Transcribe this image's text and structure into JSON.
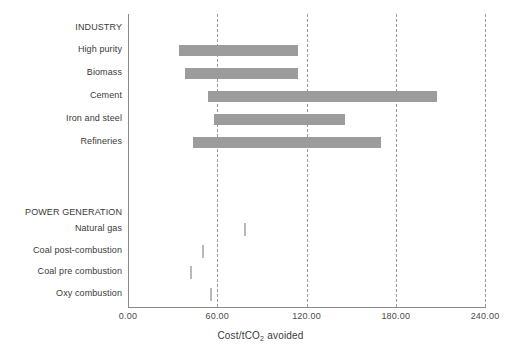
{
  "chart_data": {
    "type": "bar",
    "orientation": "horizontal",
    "title": "",
    "xlabel": "Cost/tCO2 avoided",
    "ylabel": "",
    "xlim": [
      0,
      240
    ],
    "xticks": [
      "0.00",
      "60.00",
      "120.00",
      "180.00",
      "240.00"
    ],
    "xtick_values": [
      0,
      60,
      120,
      180,
      240
    ],
    "grid": "vertical dashed gridlines at each x tick",
    "legend": "none",
    "bar_color": "#9c9c9c",
    "marker_color": "#b9b9b9",
    "groups": [
      {
        "name": "INDUSTRY",
        "categories": [
          {
            "label": "High purity",
            "low": 34,
            "high": 114
          },
          {
            "label": "Biomass",
            "low": 38,
            "high": 114
          },
          {
            "label": "Cement",
            "low": 54,
            "high": 208
          },
          {
            "label": "Iron and steel",
            "low": 58,
            "high": 146
          },
          {
            "label": "Refineries",
            "low": 44,
            "high": 170
          }
        ]
      },
      {
        "name": "POWER GENERATION",
        "categories": [
          {
            "label": "Natural gas",
            "low": 78,
            "high": 79
          },
          {
            "label": "Coal post-combustion",
            "low": 50,
            "high": 51
          },
          {
            "label": "Coal pre combustion",
            "low": 42,
            "high": 43
          },
          {
            "label": "Oxy combustion",
            "low": 55,
            "high": 56
          }
        ]
      }
    ]
  },
  "axis": {
    "x_title": "Cost/tCO",
    "x_title_sub": "2",
    "x_title_suffix": " avoided",
    "ticks": [
      {
        "label": "0.00",
        "value": 0
      },
      {
        "label": "60.00",
        "value": 60
      },
      {
        "label": "120.00",
        "value": 120
      },
      {
        "label": "180.00",
        "value": 180
      },
      {
        "label": "240.00",
        "value": 240
      }
    ]
  },
  "rows": [
    {
      "key": "industry-heading",
      "label": "INDUSTRY",
      "type": "group",
      "y": 28
    },
    {
      "key": "high-purity",
      "label": "High purity",
      "type": "bar",
      "y": 50,
      "low": 34,
      "high": 114
    },
    {
      "key": "biomass",
      "label": "Biomass",
      "type": "bar",
      "y": 73,
      "low": 38,
      "high": 114
    },
    {
      "key": "cement",
      "label": "Cement",
      "type": "bar",
      "y": 96,
      "low": 54,
      "high": 208
    },
    {
      "key": "iron-and-steel",
      "label": "Iron and steel",
      "type": "bar",
      "y": 119,
      "low": 58,
      "high": 146
    },
    {
      "key": "refineries",
      "label": "Refineries",
      "type": "bar",
      "y": 142,
      "low": 44,
      "high": 170
    },
    {
      "key": "power-generation-heading",
      "label": "POWER GENERATION",
      "type": "group",
      "y": 213
    },
    {
      "key": "natural-gas",
      "label": "Natural gas",
      "type": "marker",
      "y": 229,
      "value": 78
    },
    {
      "key": "coal-post-combustion",
      "label": "Coal post-combustion",
      "type": "marker",
      "y": 251,
      "value": 50
    },
    {
      "key": "coal-pre-combustion",
      "label": "Coal pre combustion",
      "type": "marker",
      "y": 272,
      "value": 42
    },
    {
      "key": "oxy-combustion",
      "label": "Oxy combustion",
      "type": "marker",
      "y": 294,
      "value": 55
    }
  ]
}
